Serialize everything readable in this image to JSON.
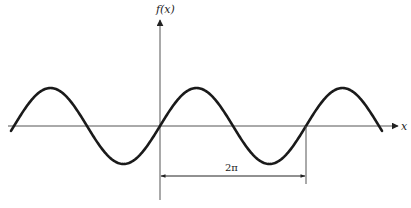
{
  "diagram": {
    "type": "sine-wave-period",
    "y_axis_label": "f(x)",
    "x_axis_label": "x",
    "period_label": "2π",
    "colors": {
      "curve": "#1a1a1a",
      "axis": "#555555",
      "text": "#222222"
    }
  }
}
